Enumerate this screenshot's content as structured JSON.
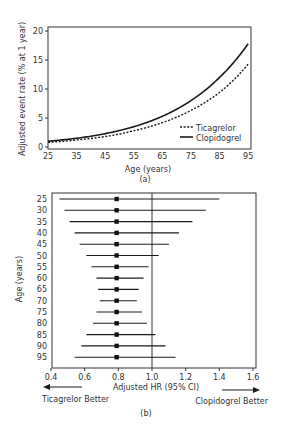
{
  "chart_data": [
    {
      "panel": "(a)",
      "type": "line",
      "title": "",
      "xlabel": "Age (years)",
      "ylabel": "Adjusted event rate (% at 1 year)",
      "x_ticks": [
        25,
        35,
        45,
        55,
        65,
        75,
        85,
        95
      ],
      "y_ticks": [
        0,
        5,
        10,
        15,
        20
      ],
      "xlim": [
        25,
        96
      ],
      "ylim": [
        0,
        21
      ],
      "grid": false,
      "legend_position": "lower right",
      "x": [
        25,
        35,
        45,
        55,
        65,
        75,
        85,
        95
      ],
      "series": [
        {
          "name": "Ticagrelor",
          "style": "dotted",
          "values": [
            0.8,
            1.2,
            1.8,
            2.8,
            4.2,
            6.3,
            9.4,
            14.3
          ]
        },
        {
          "name": "Clopidogrel",
          "style": "solid",
          "values": [
            1.0,
            1.5,
            2.3,
            3.5,
            5.3,
            8.0,
            12.0,
            17.8
          ]
        }
      ]
    },
    {
      "panel": "(b)",
      "type": "forest",
      "title": "",
      "xlabel": "Adjusted HR (95% CI)",
      "ylabel": "Age (years)",
      "x_ticks": [
        0.4,
        0.6,
        0.8,
        1.0,
        1.2,
        1.4,
        1.6
      ],
      "xlim": [
        0.4,
        1.6
      ],
      "reference_line": 1.0,
      "grid": false,
      "categories": [
        "25",
        "30",
        "35",
        "40",
        "45",
        "50",
        "55",
        "60",
        "65",
        "70",
        "75",
        "80",
        "85",
        "90",
        "95"
      ],
      "hr": [
        0.79,
        0.79,
        0.79,
        0.79,
        0.79,
        0.79,
        0.79,
        0.79,
        0.79,
        0.79,
        0.79,
        0.79,
        0.79,
        0.79,
        0.79
      ],
      "ci_lower": [
        0.45,
        0.48,
        0.51,
        0.54,
        0.57,
        0.61,
        0.64,
        0.67,
        0.68,
        0.69,
        0.67,
        0.65,
        0.61,
        0.58,
        0.54
      ],
      "ci_upper": [
        1.4,
        1.32,
        1.24,
        1.16,
        1.1,
        1.04,
        0.98,
        0.95,
        0.92,
        0.91,
        0.94,
        0.97,
        1.02,
        1.08,
        1.14
      ],
      "annotations": {
        "left_arrow_label": "Ticagrelor Better",
        "right_arrow_label": "Clopidogrel Better"
      }
    }
  ],
  "labels": {
    "panel_a": "(a)",
    "panel_b": "(b)"
  },
  "colors": {
    "line": "#1a1a1a",
    "frame": "#333333",
    "text": "#333333"
  }
}
